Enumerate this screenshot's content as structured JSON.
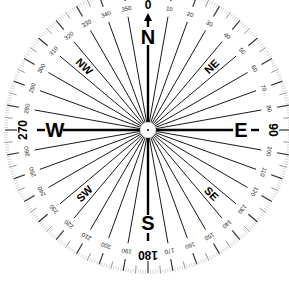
{
  "compass": {
    "center": [
      148,
      130
    ],
    "outer_radius": 145,
    "colors": {
      "ink": "#000000",
      "background": "#ffffff",
      "minor_tick": "#bbbbbb"
    },
    "cardinals": [
      {
        "label": "N",
        "angle": 0
      },
      {
        "label": "E",
        "angle": 90
      },
      {
        "label": "S",
        "angle": 180
      },
      {
        "label": "W",
        "angle": 270
      }
    ],
    "intercardinals": [
      {
        "label": "NE",
        "angle": 45
      },
      {
        "label": "SE",
        "angle": 135
      },
      {
        "label": "SW",
        "angle": 225
      },
      {
        "label": "NW",
        "angle": 315
      }
    ],
    "major_bearings": [
      {
        "label": "0",
        "angle": 0
      },
      {
        "label": "90",
        "angle": 90
      },
      {
        "label": "180",
        "angle": 180
      },
      {
        "label": "270",
        "angle": 270
      }
    ],
    "degree_labels": [
      "10",
      "20",
      "30",
      "40",
      "50",
      "60",
      "70",
      "80",
      "100",
      "110",
      "120",
      "130",
      "140",
      "150",
      "160",
      "170",
      "190",
      "200",
      "210",
      "220",
      "230",
      "240",
      "250",
      "260",
      "280",
      "290",
      "300",
      "310",
      "320",
      "330",
      "340",
      "350"
    ],
    "north_arrow": "north-arrow"
  }
}
